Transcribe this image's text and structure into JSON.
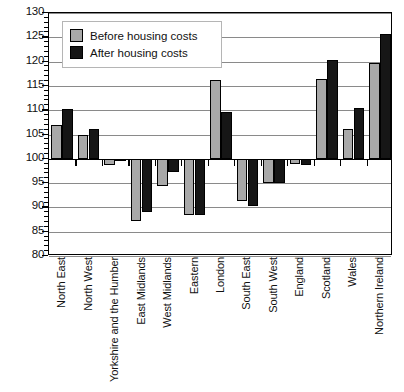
{
  "chart_data": {
    "type": "bar",
    "title": "",
    "subtitle": "",
    "xlabel": "",
    "ylabel": "",
    "ylim": [
      80,
      130
    ],
    "ytick_step": 5,
    "yticks": [
      80,
      85,
      90,
      95,
      100,
      105,
      110,
      115,
      120,
      125,
      130
    ],
    "grid": true,
    "baseline": 100,
    "legend_position": "top-left",
    "categories": [
      "North East",
      "North West",
      "Yorkshire and the Humber",
      "East Midlands",
      "West Midlands",
      "Eastern",
      "London",
      "South East",
      "South West",
      "England",
      "Scotland",
      "Wales",
      "Northern Ireland"
    ],
    "series": [
      {
        "name": "Before housing costs",
        "color": "#a8a8a8",
        "values": [
          107.0,
          105.0,
          98.8,
          87.3,
          94.3,
          88.4,
          116.3,
          91.3,
          95.0,
          98.9,
          116.4,
          106.1,
          119.7
        ]
      },
      {
        "name": "After housing costs",
        "color": "#161616",
        "values": [
          110.3,
          106.2,
          99.5,
          89.0,
          97.3,
          88.4,
          109.6,
          90.3,
          95.0,
          98.7,
          120.3,
          110.5,
          125.7
        ]
      }
    ]
  },
  "legend": {
    "items": [
      {
        "label": "Before housing costs",
        "color": "#a8a8a8"
      },
      {
        "label": "After housing costs",
        "color": "#161616"
      }
    ]
  },
  "axis": {
    "y_tick_labels": [
      "130",
      "125",
      "120",
      "115",
      "110",
      "105",
      "100",
      "95",
      "90",
      "85",
      "80"
    ]
  }
}
